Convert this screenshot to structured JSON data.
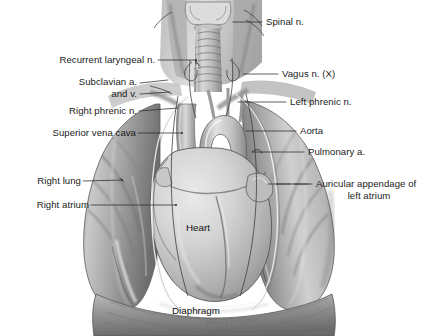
{
  "figure": {
    "background_color": "#ffffff",
    "ink_color": "#1b1b1b",
    "leader_color": "#2a2a2a",
    "artist_signature": "Robert Forstner"
  },
  "labels_left": [
    {
      "id": "recurrent-laryngeal-n",
      "text": "Recurrent laryngeal n.",
      "line2": ""
    },
    {
      "id": "subclavian-a-and-v",
      "text": "Subclavian a.",
      "line2": "and v."
    },
    {
      "id": "right-phrenic-n",
      "text": "Right phrenic n.",
      "line2": ""
    },
    {
      "id": "superior-vena-cava",
      "text": "Superior vena cava",
      "line2": ""
    },
    {
      "id": "right-lung",
      "text": "Right lung",
      "line2": ""
    },
    {
      "id": "right-atrium",
      "text": "Right atrium",
      "line2": ""
    }
  ],
  "labels_right": [
    {
      "id": "spinal-n",
      "text": "Spinal n.",
      "line2": ""
    },
    {
      "id": "vagus-n",
      "text": "Vagus n. (X)",
      "line2": ""
    },
    {
      "id": "left-phrenic-n",
      "text": "Left phrenic n.",
      "line2": ""
    },
    {
      "id": "aorta",
      "text": "Aorta",
      "line2": ""
    },
    {
      "id": "pulmonary-a",
      "text": "Pulmonary a.",
      "line2": ""
    },
    {
      "id": "auricular-appendage",
      "text": "Auricular appendage of",
      "line2": "left atrium"
    }
  ],
  "labels_inner": [
    {
      "id": "heart",
      "text": "Heart"
    },
    {
      "id": "diaphragm",
      "text": "Diaphragm"
    }
  ]
}
